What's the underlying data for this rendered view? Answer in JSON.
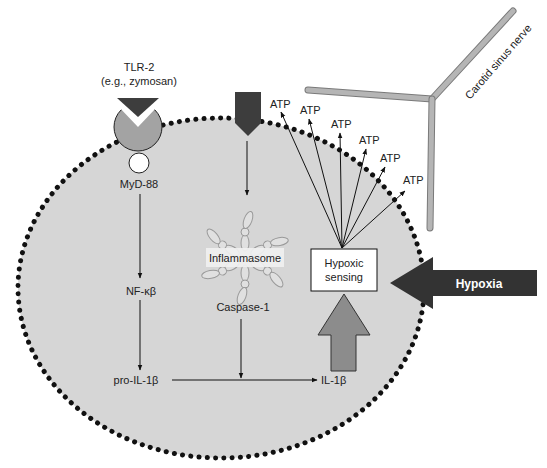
{
  "diagram": {
    "receptor": {
      "name": "TLR-2",
      "ligand": "(e.g., zymosan)"
    },
    "adaptor": "MyD-88",
    "transcription_factor": "NF-κβ",
    "precursor": "pro-IL-1β",
    "complex": "Inflammasome",
    "enzyme": "Caspase-1",
    "product": "IL-1β",
    "sensor": {
      "line1": "Hypoxic",
      "line2": "sensing"
    },
    "stimulus": "Hypoxia",
    "nerve": "Carotid sinus nerve",
    "atp_labels": [
      "ATP",
      "ATP",
      "ATP",
      "ATP",
      "ATP",
      "ATP"
    ],
    "colors": {
      "cell_fill": "#d6d6d6",
      "membrane_dots": "#111111",
      "ligand_dark": "#3d3d3d",
      "receptor_grey": "#a3a3a3",
      "hypoxia_arrow": "#333333",
      "up_arrow": "#8c8c8c",
      "nerve": "#b0b0b0"
    }
  }
}
